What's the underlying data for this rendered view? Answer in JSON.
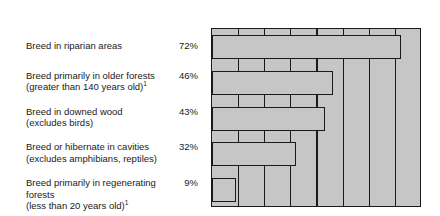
{
  "chart_data": {
    "type": "bar",
    "orientation": "horizontal",
    "title": "",
    "xlabel": "",
    "ylabel": "",
    "xlim": [
      0,
      80
    ],
    "xunit": "%",
    "grid": true,
    "grid_step": 10,
    "legend": "none",
    "axis_position": "top",
    "tick_labels": [
      "0%",
      "20%",
      "40%",
      "60%",
      "80%"
    ],
    "tick_values": [
      0,
      20,
      40,
      60,
      80
    ],
    "categories": [
      "Breed in riparian areas",
      "Breed primarily in older forests (greater than 140 years old)",
      "Breed in downed wood (excludes birds)",
      "Breed or hibernate in cavities (excludes amphibians, reptiles)",
      "Breed primarily in regenerating forests (less than 20 years old)"
    ],
    "values": [
      72,
      46,
      43,
      32,
      9
    ],
    "value_labels": [
      "72%",
      "46%",
      "43%",
      "32%",
      "9%"
    ],
    "footnote_marks": [
      null,
      "1",
      null,
      null,
      "1"
    ],
    "colors": {
      "bar_fill": "#c6c6c6",
      "bar_stroke": "#1a1a1a",
      "plot_background": "#c6c6c6",
      "page_background": "#ffffff",
      "text": "#1a1a1a"
    }
  },
  "axis": {
    "ticks": [
      {
        "label": "0%",
        "value": 0
      },
      {
        "label": "20%",
        "value": 20
      },
      {
        "label": "40%",
        "value": 40
      },
      {
        "label": "60%",
        "value": 60
      },
      {
        "label": "80%",
        "value": 80
      }
    ]
  },
  "rows": [
    {
      "line1": "Breed in riparian areas",
      "line2": "",
      "sup": "",
      "value": "72%",
      "pct": 72
    },
    {
      "line1": "Breed primarily in older forests",
      "line2": "(greater than 140 years old)",
      "sup": "1",
      "value": "46%",
      "pct": 46
    },
    {
      "line1": "Breed in downed wood",
      "line2": "(excludes birds)",
      "sup": "",
      "value": "43%",
      "pct": 43
    },
    {
      "line1": "Breed or hibernate in cavities",
      "line2": "(excludes amphibians, reptiles)",
      "sup": "",
      "value": "32%",
      "pct": 32
    },
    {
      "line1": "Breed primarily in regenerating forests",
      "line2": "(less than 20 years old)",
      "sup": "1",
      "value": "9%",
      "pct": 9
    }
  ]
}
